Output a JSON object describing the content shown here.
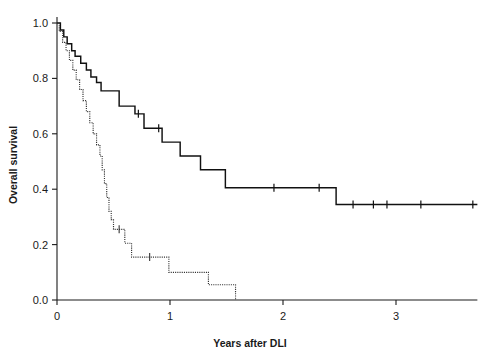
{
  "chart_data": {
    "type": "line",
    "title": "",
    "subtitle": "",
    "xlabel": "Years after DLI",
    "ylabel": "Overall survival",
    "xlim": [
      0,
      3.72
    ],
    "ylim": [
      0.0,
      1.0
    ],
    "grid": false,
    "legend_position": "none",
    "xticks": [
      0,
      1,
      2,
      3
    ],
    "xtick_labels": [
      "0",
      "1",
      "2",
      "3"
    ],
    "yticks": [
      0.0,
      0.2,
      0.4,
      0.6,
      0.8,
      1.0
    ],
    "ytick_labels": [
      "0.0",
      "0.2",
      "0.4",
      "0.6",
      "0.8",
      "1.0"
    ],
    "series": [
      {
        "name": "solid-curve",
        "style": "solid",
        "color": "#111111",
        "steps": [
          [
            0.0,
            1.0
          ],
          [
            0.03,
            0.975
          ],
          [
            0.06,
            0.95
          ],
          [
            0.09,
            0.925
          ],
          [
            0.13,
            0.9
          ],
          [
            0.16,
            0.88
          ],
          [
            0.21,
            0.855
          ],
          [
            0.26,
            0.83
          ],
          [
            0.3,
            0.805
          ],
          [
            0.35,
            0.785
          ],
          [
            0.39,
            0.755
          ],
          [
            0.52,
            0.755
          ],
          [
            0.55,
            0.7
          ],
          [
            0.66,
            0.7
          ],
          [
            0.69,
            0.672
          ],
          [
            0.74,
            0.672
          ],
          [
            0.77,
            0.62
          ],
          [
            0.9,
            0.62
          ],
          [
            0.93,
            0.57
          ],
          [
            1.06,
            0.57
          ],
          [
            1.09,
            0.52
          ],
          [
            1.24,
            0.52
          ],
          [
            1.27,
            0.47
          ],
          [
            1.46,
            0.47
          ],
          [
            1.49,
            0.405
          ],
          [
            2.44,
            0.405
          ],
          [
            2.47,
            0.345
          ],
          [
            3.7,
            0.345
          ]
        ],
        "censor_times": [
          0.72,
          0.9,
          1.92,
          2.32,
          2.62,
          2.8,
          2.92,
          3.22,
          3.68
        ],
        "censor_values": [
          0.672,
          0.62,
          0.405,
          0.405,
          0.345,
          0.345,
          0.345,
          0.345,
          0.345
        ]
      },
      {
        "name": "dotted-curve",
        "style": "dotted",
        "color": "#333333",
        "steps": [
          [
            0.0,
            1.0
          ],
          [
            0.02,
            0.97
          ],
          [
            0.05,
            0.93
          ],
          [
            0.08,
            0.9
          ],
          [
            0.11,
            0.865
          ],
          [
            0.14,
            0.83
          ],
          [
            0.17,
            0.795
          ],
          [
            0.2,
            0.76
          ],
          [
            0.23,
            0.72
          ],
          [
            0.26,
            0.68
          ],
          [
            0.29,
            0.64
          ],
          [
            0.32,
            0.6
          ],
          [
            0.35,
            0.56
          ],
          [
            0.38,
            0.52
          ],
          [
            0.4,
            0.47
          ],
          [
            0.42,
            0.42
          ],
          [
            0.44,
            0.37
          ],
          [
            0.46,
            0.32
          ],
          [
            0.48,
            0.29
          ],
          [
            0.5,
            0.255
          ],
          [
            0.58,
            0.255
          ],
          [
            0.6,
            0.205
          ],
          [
            0.64,
            0.205
          ],
          [
            0.66,
            0.155
          ],
          [
            0.96,
            0.155
          ],
          [
            0.99,
            0.1
          ],
          [
            1.31,
            0.1
          ],
          [
            1.34,
            0.055
          ],
          [
            1.55,
            0.055
          ],
          [
            1.58,
            0.0
          ]
        ],
        "censor_times": [
          0.55,
          0.82
        ],
        "censor_values": [
          0.255,
          0.155
        ]
      }
    ]
  }
}
